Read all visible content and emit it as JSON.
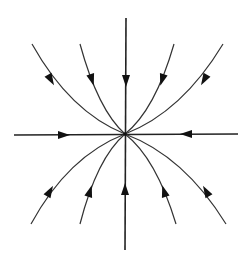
{
  "diagram": {
    "type": "phase-portrait",
    "stroke_color": "#333333",
    "arrow_color": "#111111",
    "background": "#ffffff",
    "center": [
      125,
      134
    ],
    "axes": [
      {
        "id": "horizontal-left",
        "from": [
          14,
          135
        ],
        "to": [
          125,
          134
        ],
        "arrow_at": [
          62,
          135
        ],
        "direction": "right"
      },
      {
        "id": "horizontal-right",
        "from": [
          238,
          134
        ],
        "to": [
          125,
          134
        ],
        "arrow_at": [
          188,
          134
        ],
        "direction": "left"
      },
      {
        "id": "vertical-top",
        "from": [
          126,
          18
        ],
        "to": [
          125,
          134
        ],
        "arrow_at": [
          126,
          80
        ],
        "direction": "down"
      },
      {
        "id": "vertical-bottom",
        "from": [
          125,
          250
        ],
        "to": [
          125,
          134
        ],
        "arrow_at": [
          125,
          190
        ],
        "direction": "up"
      }
    ],
    "trajectories": [
      {
        "id": "top-1",
        "from": [
          32,
          44
        ],
        "arrow_at": [
          51,
          79
        ],
        "direction": "inward"
      },
      {
        "id": "top-2",
        "from": [
          80,
          44
        ],
        "arrow_at": [
          91,
          79
        ],
        "direction": "inward"
      },
      {
        "id": "top-3",
        "from": [
          174,
          44
        ],
        "arrow_at": [
          163,
          79
        ],
        "direction": "inward"
      },
      {
        "id": "top-4",
        "from": [
          223,
          44
        ],
        "arrow_at": [
          204,
          79
        ],
        "direction": "inward"
      },
      {
        "id": "bottom-1",
        "from": [
          31,
          224
        ],
        "arrow_at": [
          50,
          192
        ],
        "direction": "inward"
      },
      {
        "id": "bottom-2",
        "from": [
          80,
          224
        ],
        "arrow_at": [
          90,
          192
        ],
        "direction": "inward"
      },
      {
        "id": "bottom-3",
        "from": [
          176,
          224
        ],
        "arrow_at": [
          164,
          192
        ],
        "direction": "inward"
      },
      {
        "id": "bottom-4",
        "from": [
          226,
          224
        ],
        "arrow_at": [
          206,
          192
        ],
        "direction": "inward"
      }
    ]
  }
}
